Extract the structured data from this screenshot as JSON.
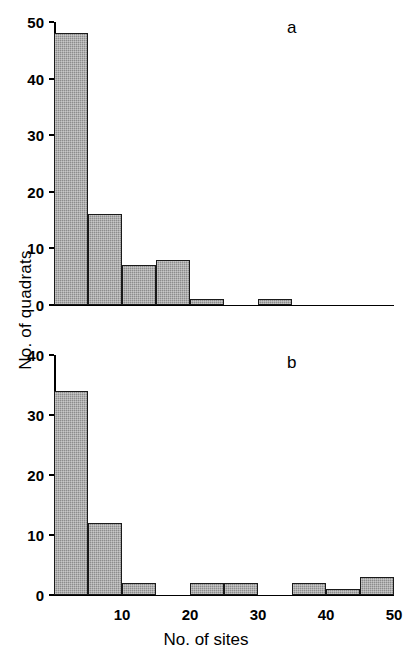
{
  "figure": {
    "y_axis_title": "No. of quadrats",
    "x_axis_title": "No. of sites",
    "bar_color": "#8c8c8c",
    "axis_color": "#000000",
    "panel_a_letter": "a",
    "panel_b_letter": "b"
  },
  "chart_data": [
    {
      "type": "bar",
      "panel": "a",
      "title": "a",
      "xlabel": "No. of sites",
      "ylabel": "No. of quadrats",
      "bin_width": 5,
      "xlim": [
        0,
        50
      ],
      "ylim": [
        0,
        50
      ],
      "yticks": [
        0,
        10,
        20,
        30,
        40,
        50
      ],
      "ytick_labels": [
        "0",
        "10",
        "20",
        "30",
        "40",
        "50"
      ],
      "xticks": [
        10,
        20,
        30,
        40,
        50
      ],
      "xtick_labels": [
        "10",
        "20",
        "30",
        "40",
        "50"
      ],
      "grid": false,
      "legend": null,
      "bins": [
        "0-5",
        "5-10",
        "10-15",
        "15-20",
        "20-25",
        "25-30",
        "30-35",
        "35-40",
        "40-45",
        "45-50"
      ],
      "bin_starts": [
        0,
        5,
        10,
        15,
        20,
        25,
        30,
        35,
        40,
        45
      ],
      "values": [
        48,
        16,
        7,
        8,
        1,
        0,
        1,
        0,
        0,
        0
      ]
    },
    {
      "type": "bar",
      "panel": "b",
      "title": "b",
      "xlabel": "No. of sites",
      "ylabel": "No. of quadrats",
      "bin_width": 5,
      "xlim": [
        0,
        50
      ],
      "ylim": [
        0,
        40
      ],
      "yticks": [
        0,
        10,
        20,
        30,
        40
      ],
      "ytick_labels": [
        "0",
        "10",
        "20",
        "30",
        "40"
      ],
      "xticks": [
        10,
        20,
        30,
        40,
        50
      ],
      "xtick_labels": [
        "10",
        "20",
        "30",
        "40",
        "50"
      ],
      "grid": false,
      "legend": null,
      "bins": [
        "0-5",
        "5-10",
        "10-15",
        "15-20",
        "20-25",
        "25-30",
        "30-35",
        "35-40",
        "40-45",
        "45-50"
      ],
      "bin_starts": [
        0,
        5,
        10,
        15,
        20,
        25,
        30,
        35,
        40,
        45
      ],
      "values": [
        34,
        12,
        2,
        0,
        2,
        2,
        0,
        2,
        1,
        3
      ]
    }
  ]
}
